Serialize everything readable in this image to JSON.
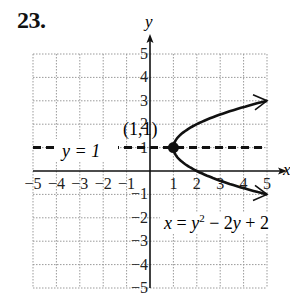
{
  "problem_number": "23.",
  "chart_data": {
    "type": "line",
    "title": "",
    "xlabel": "x",
    "ylabel": "y",
    "xlim": [
      -5,
      5
    ],
    "ylim": [
      -5,
      5
    ],
    "grid": true,
    "x_ticks": [
      "-5",
      "-4",
      "-3",
      "-2",
      "-1",
      "1",
      "2",
      "3",
      "4",
      "5"
    ],
    "y_ticks": [
      "5",
      "4",
      "3",
      "2",
      "1",
      "-1",
      "-2",
      "-3",
      "-4",
      "-5"
    ],
    "series": [
      {
        "name": "x = y^2 - 2y + 2",
        "style": "solid",
        "with_arrows": true,
        "points": [
          [
            5,
            -1
          ],
          [
            3.25,
            -0.5
          ],
          [
            2,
            0
          ],
          [
            1.25,
            0.5
          ],
          [
            1,
            1
          ],
          [
            1.25,
            1.5
          ],
          [
            2,
            2
          ],
          [
            3.25,
            2.5
          ],
          [
            5,
            3
          ]
        ]
      },
      {
        "name": "y = 1",
        "style": "dashed",
        "points": [
          [
            -5,
            1
          ],
          [
            5,
            1
          ]
        ]
      }
    ],
    "annotations": [
      {
        "text": "(1,1)",
        "x": 1,
        "y": 1,
        "marker": "filled-dot",
        "label": "vertex"
      },
      {
        "text": "y =  1",
        "role": "line label"
      },
      {
        "text": "x = y² − 2y + 2",
        "role": "curve label"
      }
    ]
  },
  "labels": {
    "axis_x": "x",
    "axis_y": "y",
    "vertex": "(1,1)",
    "line_eq": "y =  1",
    "curve_eq_x": "x",
    "curve_eq_eq": " = ",
    "curve_eq_y": "y",
    "curve_eq_sup": "2",
    "curve_eq_rest1": " − 2",
    "curve_eq_y2": "y",
    "curve_eq_rest2": " + 2"
  }
}
